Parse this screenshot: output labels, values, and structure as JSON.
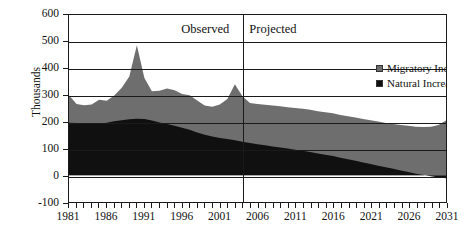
{
  "chart_data": {
    "type": "area",
    "stacked": true,
    "title": "",
    "xlabel": "",
    "ylabel": "Thousands",
    "xlim": [
      1981,
      2031
    ],
    "ylim": [
      -100,
      600
    ],
    "ytick_values": [
      -100,
      0,
      100,
      200,
      300,
      400,
      500,
      600
    ],
    "ytick_labels": [
      "-100",
      "0",
      "100",
      "200",
      "300",
      "400",
      "500",
      "600"
    ],
    "xtick_values": [
      1981,
      1986,
      1991,
      1996,
      2001,
      2006,
      2011,
      2016,
      2021,
      2026,
      2031
    ],
    "xtick_labels": [
      "1981",
      "1986",
      "1991",
      "1996",
      "2001",
      "2006",
      "2011",
      "2016",
      "2021",
      "2026",
      "2031"
    ],
    "xtick_minor_step": 1,
    "grid": "horizontal",
    "legend_position": "top-right-inside",
    "x": [
      1981,
      1982,
      1983,
      1984,
      1985,
      1986,
      1987,
      1988,
      1989,
      1990,
      1991,
      1992,
      1993,
      1994,
      1995,
      1996,
      1997,
      1998,
      1999,
      2000,
      2001,
      2002,
      2003,
      2004,
      2005,
      2006,
      2007,
      2008,
      2009,
      2010,
      2011,
      2012,
      2013,
      2014,
      2015,
      2016,
      2017,
      2018,
      2019,
      2020,
      2021,
      2022,
      2023,
      2024,
      2025,
      2026,
      2027,
      2028,
      2029,
      2030,
      2031
    ],
    "series": [
      {
        "name": "Natural Increase",
        "color": "#101010",
        "values": [
          197,
          196,
          194,
          192,
          193,
          197,
          202,
          206,
          210,
          212,
          211,
          205,
          198,
          192,
          185,
          178,
          170,
          160,
          152,
          145,
          140,
          136,
          131,
          126,
          121,
          116,
          112,
          108,
          104,
          100,
          96,
          92,
          87,
          82,
          77,
          72,
          66,
          60,
          54,
          48,
          42,
          36,
          30,
          24,
          18,
          12,
          6,
          1,
          -4,
          -8,
          -11
        ]
      },
      {
        "name": "Migratory Increase",
        "color": "#6e6e6e",
        "values": [
          103,
          71,
          68,
          73,
          90,
          82,
          97,
          122,
          160,
          275,
          153,
          110,
          118,
          133,
          133,
          126,
          130,
          120,
          109,
          112,
          125,
          150,
          210,
          170,
          150,
          151,
          152,
          153,
          154,
          155,
          156,
          157,
          158,
          158,
          159,
          160,
          160,
          161,
          162,
          163,
          164,
          165,
          166,
          168,
          170,
          173,
          176,
          180,
          186,
          196,
          216
        ]
      }
    ],
    "totals": [
      300,
      267,
      262,
      265,
      283,
      279,
      299,
      328,
      370,
      487,
      364,
      315,
      316,
      325,
      318,
      304,
      300,
      280,
      261,
      257,
      265,
      286,
      341,
      296,
      271,
      267,
      264,
      261,
      258,
      255,
      252,
      249,
      245,
      240,
      236,
      232,
      226,
      221,
      216,
      211,
      206,
      201,
      196,
      192,
      188,
      185,
      182,
      181,
      182,
      188,
      205
    ],
    "annotations": [
      {
        "text": "Observed",
        "x": 2000.5,
        "y": 565
      },
      {
        "text": "Projected",
        "x": 2005.0,
        "y": 565
      }
    ],
    "divider_x": 2004
  },
  "legend": {
    "items": [
      {
        "label": "Migratory Increase",
        "color": "#6e6e6e",
        "swatch": "square-gray"
      },
      {
        "label": "Natural Increase",
        "color": "#101010",
        "swatch": "square-black"
      }
    ]
  },
  "phase_labels": {
    "observed": "Observed",
    "projected": "Projected"
  },
  "axes": {
    "y_title": "Thousands"
  },
  "colors": {
    "migratory": "#6e6e6e",
    "natural": "#101010",
    "axis": "#1a1a1a",
    "background": "#ffffff"
  }
}
